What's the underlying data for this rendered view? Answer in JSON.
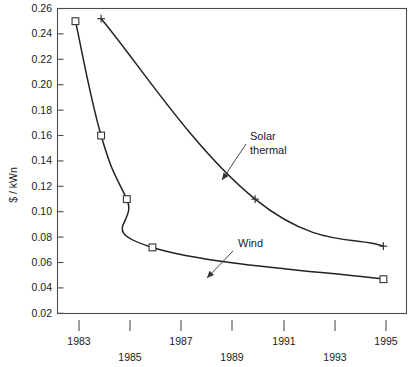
{
  "chart_data": {
    "type": "line",
    "title": "",
    "xlabel": "",
    "ylabel": "$ / kWn",
    "xlim": [
      1982.3,
      1995.9
    ],
    "ylim": [
      0.02,
      0.26
    ],
    "grid": false,
    "legend_position": "inline-annotations",
    "x_ticks": [
      1983,
      1985,
      1987,
      1989,
      1991,
      1993,
      1995
    ],
    "x_tick_labels": [
      "1983",
      "1985",
      "1987",
      "1989",
      "1991",
      "1993",
      "1995"
    ],
    "y_ticks": [
      0.02,
      0.04,
      0.06,
      0.08,
      0.1,
      0.12,
      0.14,
      0.16,
      0.18,
      0.2,
      0.22,
      0.24,
      0.26
    ],
    "y_tick_labels": [
      "0.02",
      "0.04",
      "0.06",
      "0.08",
      "0.10",
      "0.12",
      "0.14",
      "0.16",
      "0.18",
      "0.20",
      "0.22",
      "0.24",
      "0.26"
    ],
    "series": [
      {
        "name": "Wind",
        "marker": "square",
        "x": [
          1983,
          1984,
          1985,
          1986,
          1995
        ],
        "values": [
          0.25,
          0.16,
          0.11,
          0.072,
          0.047
        ]
      },
      {
        "name": "Solar thermal",
        "marker": "plus",
        "x": [
          1984,
          1990,
          1995
        ],
        "values": [
          0.252,
          0.11,
          0.073
        ]
      }
    ],
    "annotations": [
      {
        "text_line1": "Solar",
        "text_line2": "thermal",
        "points_to_series": "Solar thermal"
      },
      {
        "text_line1": "Wind",
        "text_line2": "",
        "points_to_series": "Wind"
      }
    ]
  },
  "axis": {
    "y_title": "$ / kWn"
  },
  "annotations": {
    "solar_line1": "Solar",
    "solar_line2": "thermal",
    "wind_label": "Wind"
  },
  "ticks": {
    "y": {
      "t0": "0.26",
      "t1": "0.24",
      "t2": "0.22",
      "t3": "0.20",
      "t4": "0.18",
      "t5": "0.16",
      "t6": "0.14",
      "t7": "0.12",
      "t8": "0.10",
      "t9": "0.08",
      "t10": "0.06",
      "t11": "0.04",
      "t12": "0.02"
    },
    "x": {
      "t0": "1983",
      "t1": "1985",
      "t2": "1987",
      "t3": "1989",
      "t4": "1991",
      "t5": "1993",
      "t6": "1995"
    }
  }
}
